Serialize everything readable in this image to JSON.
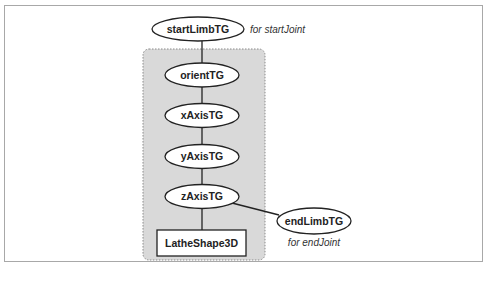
{
  "diagram": {
    "group_box": {
      "fill": "#d9d9d9",
      "border": "#8a8a8a"
    },
    "nodes": {
      "startLimbTG": {
        "label": "startLimbTG",
        "shape": "ellipse"
      },
      "orientTG": {
        "label": "orientTG",
        "shape": "ellipse"
      },
      "xAxisTG": {
        "label": "xAxisTG",
        "shape": "ellipse"
      },
      "yAxisTG": {
        "label": "yAxisTG",
        "shape": "ellipse"
      },
      "zAxisTG": {
        "label": "zAxisTG",
        "shape": "ellipse"
      },
      "LatheShape3D": {
        "label": "LatheShape3D",
        "shape": "rectangle"
      },
      "endLimbTG": {
        "label": "endLimbTG",
        "shape": "ellipse"
      }
    },
    "annotations": {
      "start": "for startJoint",
      "end": "for endJoint"
    },
    "edges": [
      [
        "startLimbTG",
        "orientTG"
      ],
      [
        "orientTG",
        "xAxisTG"
      ],
      [
        "xAxisTG",
        "yAxisTG"
      ],
      [
        "yAxisTG",
        "zAxisTG"
      ],
      [
        "zAxisTG",
        "LatheShape3D"
      ],
      [
        "zAxisTG",
        "endLimbTG"
      ]
    ]
  }
}
